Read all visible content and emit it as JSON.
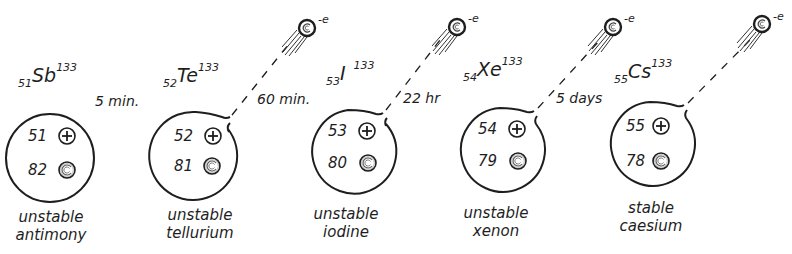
{
  "colors": {
    "ink": "#1e1e1e",
    "background": "#ffffff"
  },
  "atoms": [
    {
      "element": "Sb",
      "atomic_number": "51",
      "mass_number": "133",
      "protons": "51",
      "neutrons": "82",
      "stability": "unstable",
      "name": "antimony"
    },
    {
      "element": "Te",
      "atomic_number": "52",
      "mass_number": "133",
      "protons": "52",
      "neutrons": "81",
      "stability": "unstable",
      "name": "tellurium"
    },
    {
      "element": "I",
      "atomic_number": "53",
      "mass_number": "133",
      "protons": "53",
      "neutrons": "80",
      "stability": "unstable",
      "name": "iodine"
    },
    {
      "element": "Xe",
      "atomic_number": "54",
      "mass_number": "133",
      "protons": "54",
      "neutrons": "79",
      "stability": "unstable",
      "name": "xenon"
    },
    {
      "element": "Cs",
      "atomic_number": "55",
      "mass_number": "133",
      "protons": "55",
      "neutrons": "78",
      "stability": "stable",
      "name": "caesium"
    }
  ],
  "half_lives": [
    "5 min.",
    "60 min.",
    "22 hr",
    "5 days"
  ],
  "electron_label": "e",
  "electron_charge": "-",
  "icons": {
    "proton": "plus-in-circle",
    "neutron": "spiral-circle",
    "electron": "spiral-ball-with-trail"
  }
}
